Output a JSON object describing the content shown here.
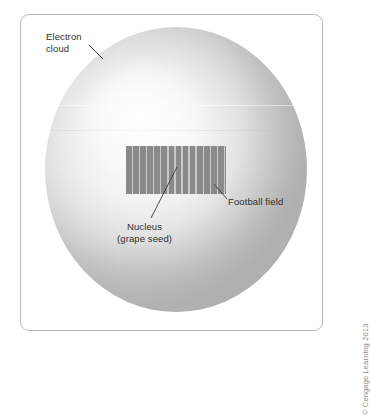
{
  "figure": {
    "background_color": "#ffffff",
    "panel": {
      "border_color": "#b9b9b9",
      "fill_color": "#ffffff"
    },
    "sphere": {
      "name": "electron cloud sphere",
      "fill_light": "#fbfbfb",
      "fill_dark": "#c0c0c0"
    },
    "field": {
      "name": "football field rectangle",
      "fill_color": "#8a8a8a",
      "line_color": "#c9c9c9",
      "yard_line_count": 14
    }
  },
  "labels": {
    "electron_cloud": "Electron\ncloud",
    "nucleus": "Nucleus\n(grape seed)",
    "football_field": "Football field"
  },
  "credit": {
    "text": "© Cengage Learning 2013"
  }
}
